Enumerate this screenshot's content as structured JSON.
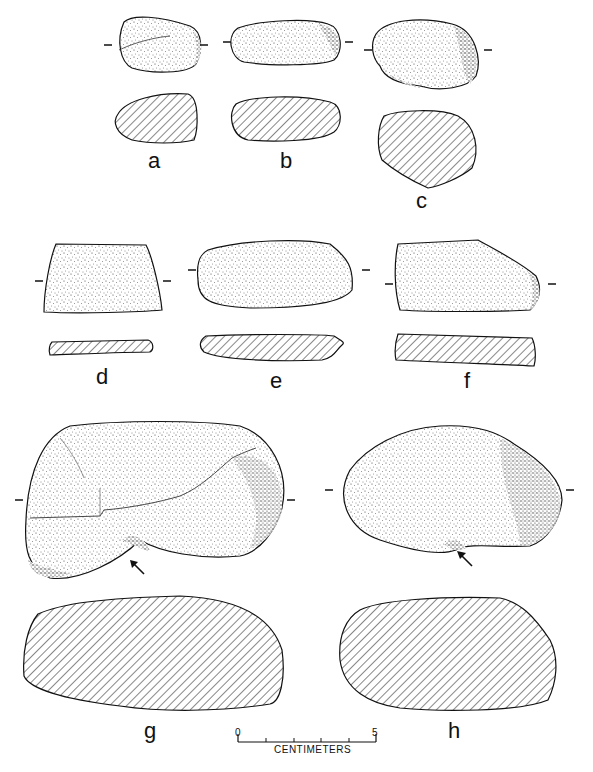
{
  "figure": {
    "type": "archaeological artifact plate",
    "background": "#ffffff",
    "ink": "#111111",
    "specimens": [
      {
        "id": "a",
        "label": "a",
        "has_section": true
      },
      {
        "id": "b",
        "label": "b",
        "has_section": true
      },
      {
        "id": "c",
        "label": "c",
        "has_section": true
      },
      {
        "id": "d",
        "label": "d",
        "has_section": true
      },
      {
        "id": "e",
        "label": "e",
        "has_section": true
      },
      {
        "id": "f",
        "label": "f",
        "has_section": true
      },
      {
        "id": "g",
        "label": "g",
        "has_section": true,
        "arrow": true
      },
      {
        "id": "h",
        "label": "h",
        "has_section": true,
        "arrow": true
      }
    ]
  },
  "scale_bar": {
    "start": "0",
    "end": "5",
    "unit": "CENTIMETERS"
  }
}
